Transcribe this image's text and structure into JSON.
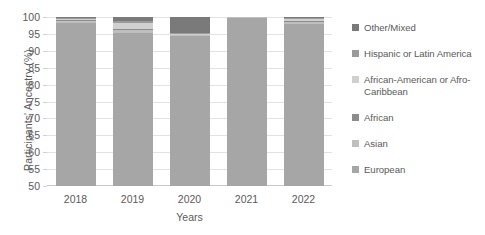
{
  "chart_data": {
    "type": "bar",
    "subtype": "stacked-column-100",
    "title": "",
    "xlabel": "Years",
    "ylabel": "Participants' Ancestry (%)",
    "categories": [
      "2018",
      "2019",
      "2020",
      "2021",
      "2022"
    ],
    "ylim": [
      50,
      100
    ],
    "yticks": [
      50,
      55,
      60,
      65,
      70,
      75,
      80,
      85,
      90,
      95,
      100
    ],
    "ytick_labels": [
      "50",
      "55",
      "60",
      "65",
      "70",
      "75",
      "80",
      "85",
      "90",
      "95",
      "100"
    ],
    "grid": true,
    "legend_position": "right",
    "stack_order_bottom_to_top": [
      "European",
      "Asian",
      "African",
      "African-American or Afro-Caribbean",
      "Hispanic or Latin America",
      "Other/Mixed"
    ],
    "series": [
      {
        "name": "European",
        "color": "#a6a6a6",
        "values": [
          98.2,
          95.4,
          94.3,
          99.8,
          97.9
        ]
      },
      {
        "name": "Asian",
        "color": "#bfbfbf",
        "values": [
          0.5,
          0.7,
          0.3,
          0.1,
          0.5
        ]
      },
      {
        "name": "African",
        "color": "#8c8c8c",
        "values": [
          0.4,
          0.5,
          0.2,
          0.05,
          0.4
        ]
      },
      {
        "name": "African-American or Afro-Caribbean",
        "color": "#d0d0d0",
        "values": [
          0.3,
          1.6,
          0.2,
          0.05,
          0.5
        ]
      },
      {
        "name": "Hispanic or Latin America",
        "color": "#9a9a9a",
        "values": [
          0.3,
          0.6,
          0.2,
          0.0,
          0.3
        ]
      },
      {
        "name": "Other/Mixed",
        "color": "#7a7a7a",
        "values": [
          0.3,
          1.2,
          4.8,
          0.0,
          0.4
        ]
      }
    ],
    "legend_entries": [
      {
        "label": "Other/Mixed",
        "color": "#7a7a7a"
      },
      {
        "label": "Hispanic or Latin America",
        "color": "#9a9a9a"
      },
      {
        "label": "African-American or Afro-Caribbean",
        "color": "#d0d0d0"
      },
      {
        "label": "African",
        "color": "#8c8c8c"
      },
      {
        "label": "Asian",
        "color": "#bfbfbf"
      },
      {
        "label": "European",
        "color": "#a6a6a6"
      }
    ]
  },
  "colors": {
    "grid": "#e2e2e2",
    "axis": "#c9c9c9",
    "text": "#5a5a5a",
    "background": "#ffffff"
  }
}
